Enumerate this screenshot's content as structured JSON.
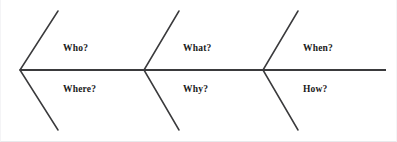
{
  "diagram": {
    "type": "fishbone-ishikawa",
    "title": "",
    "stroke_color": "#3a3a3c",
    "background_color": "#ffffff",
    "spine": {
      "name": "spine",
      "x1": 19,
      "y1": 70,
      "x2": 385,
      "y2": 70,
      "stroke_width": 1.8
    },
    "branches": [
      {
        "id": "branch-1",
        "vertex": {
          "x": 19,
          "y": 70
        },
        "upper_label": "Who?",
        "lower_label": "Where?",
        "upper_line": {
          "x1": 19,
          "y1": 70,
          "x2": 57,
          "y2": 11
        },
        "lower_line": {
          "x1": 19,
          "y1": 70,
          "x2": 57,
          "y2": 130
        }
      },
      {
        "id": "branch-2",
        "vertex": {
          "x": 143,
          "y": 70
        },
        "upper_label": "What?",
        "lower_label": "Why?",
        "upper_line": {
          "x1": 143,
          "y1": 70,
          "x2": 178,
          "y2": 11
        },
        "lower_line": {
          "x1": 143,
          "y1": 70,
          "x2": 178,
          "y2": 130
        }
      },
      {
        "id": "branch-3",
        "vertex": {
          "x": 262,
          "y": 70
        },
        "upper_label": "When?",
        "lower_label": "How?",
        "upper_line": {
          "x1": 262,
          "y1": 70,
          "x2": 297,
          "y2": 11
        },
        "lower_line": {
          "x1": 262,
          "y1": 70,
          "x2": 297,
          "y2": 130
        }
      }
    ],
    "labels": {
      "who": "Who?",
      "where": "Where?",
      "what": "What?",
      "why": "Why?",
      "when": "When?",
      "how": "How?"
    }
  }
}
